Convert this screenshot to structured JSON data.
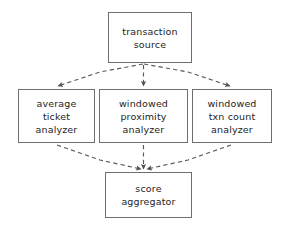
{
  "diagram": {
    "type": "flow-diagram",
    "style": "hand-drawn",
    "background_color": "#ffffff",
    "box_border_color": "#6f6f6f",
    "text_color": "#1d1d1d",
    "connector_color": "#5a5a5a",
    "connector_style": "dashed-with-solid-arrowhead",
    "nodes": [
      {
        "id": "transaction-source",
        "lines": [
          "transaction",
          "source"
        ]
      },
      {
        "id": "average-ticket-analyzer",
        "lines": [
          "average",
          "ticket",
          "analyzer"
        ]
      },
      {
        "id": "windowed-proximity-analyzer",
        "lines": [
          "windowed",
          "proximity",
          "analyzer"
        ]
      },
      {
        "id": "windowed-txn-count-analyzer",
        "lines": [
          "windowed",
          "txn count",
          "analyzer"
        ]
      },
      {
        "id": "score-aggregator",
        "lines": [
          "score",
          "aggregator"
        ]
      }
    ],
    "edges": [
      {
        "from": "transaction-source",
        "to": "average-ticket-analyzer"
      },
      {
        "from": "transaction-source",
        "to": "windowed-proximity-analyzer"
      },
      {
        "from": "transaction-source",
        "to": "windowed-txn-count-analyzer"
      },
      {
        "from": "average-ticket-analyzer",
        "to": "score-aggregator"
      },
      {
        "from": "windowed-proximity-analyzer",
        "to": "score-aggregator"
      },
      {
        "from": "windowed-txn-count-analyzer",
        "to": "score-aggregator"
      }
    ]
  }
}
